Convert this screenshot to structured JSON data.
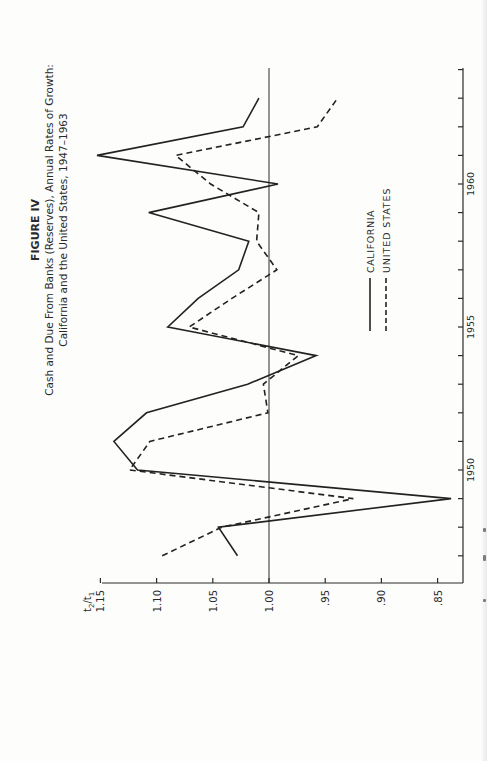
{
  "figure": {
    "label": "FIGURE IV",
    "title_line1": "Cash and Due From Banks (Reserves), Annual Rates of Growth:",
    "title_line2": "California and the United States, 1947–1963"
  },
  "axes": {
    "value_axis_label_main": "t",
    "value_axis_label_sub2": "2",
    "value_axis_label_slash": "/",
    "value_axis_label_sub1": "1",
    "value_ticks": [
      "1.15",
      "1.10",
      "1.05",
      "1.00",
      ".95",
      ".90",
      ".85"
    ],
    "year_tick_labels": [
      "1950",
      "1955",
      "1960"
    ]
  },
  "legend": {
    "california": "CALIFORNIA",
    "united_states": "UNITED STATES"
  },
  "colors": {
    "ink": "#2a2a2a",
    "paper": "#fdfdfc"
  },
  "chart_data": {
    "type": "line",
    "xlabel": "Year",
    "ylabel": "t2/t1",
    "orientation_note": "figure printed rotated 90° counter-clockwise on page",
    "x": [
      1947,
      1948,
      1949,
      1950,
      1951,
      1952,
      1953,
      1954,
      1955,
      1956,
      1957,
      1958,
      1959,
      1960,
      1961,
      1962,
      1963
    ],
    "series": [
      {
        "name": "CALIFORNIA",
        "style": "solid",
        "values": [
          1.028,
          1.045,
          0.838,
          1.117,
          1.138,
          1.109,
          1.019,
          0.958,
          1.09,
          1.063,
          1.027,
          1.018,
          1.107,
          0.992,
          1.153,
          1.023,
          1.009
        ]
      },
      {
        "name": "UNITED STATES",
        "style": "dashed",
        "values": [
          1.095,
          1.042,
          0.925,
          1.124,
          1.106,
          1.001,
          1.005,
          0.974,
          1.071,
          1.033,
          0.993,
          1.011,
          1.009,
          1.052,
          1.083,
          0.957,
          0.939
        ]
      }
    ],
    "reference_line": 1.0,
    "ylim": [
      0.83,
      1.15
    ],
    "xlim": [
      1946,
      1964
    ],
    "y_ticks": [
      1.15,
      1.1,
      1.05,
      1.0,
      0.95,
      0.9,
      0.85
    ],
    "x_tick_labels": [
      1950,
      1955,
      1960
    ],
    "grid": false,
    "legend_position": "inside, lower-right region (rotated)"
  }
}
